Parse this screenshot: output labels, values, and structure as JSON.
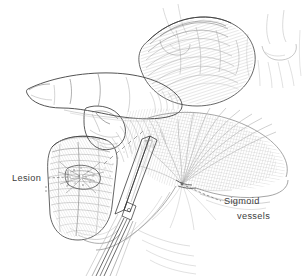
{
  "figure": {
    "kind": "surgical-line-illustration",
    "background_color": "#ffffff",
    "ink_color": "#4a4a4a",
    "hatch_color": "#9a9a9a",
    "label_color": "#3d3d3d"
  },
  "labels": [
    {
      "id": "lesion",
      "text": "Lesion",
      "text_x": 12,
      "text_y": 181,
      "anchor": "start",
      "leader_style": "dashed-horizontal-with-bracket"
    },
    {
      "id": "sigmoid-vessels",
      "line1": "Sigmoid",
      "line2": "vessels",
      "line1_x": 224,
      "line1_y": 204,
      "line2_x": 237,
      "line2_y": 219,
      "anchor": "start",
      "leader_style": "dashed-diagonal"
    }
  ],
  "structures": [
    {
      "id": "index-finger",
      "name": "surgeon index finger"
    },
    {
      "id": "thumb",
      "name": "surgeon thumb"
    },
    {
      "id": "sigmoid-loop",
      "name": "sigmoid colon loop"
    },
    {
      "id": "bowel-segment",
      "name": "bowel segment bearing lesion"
    },
    {
      "id": "lesion-mass",
      "name": "puckered lesion on antimesenteric wall"
    },
    {
      "id": "mesentery-fan",
      "name": "sigmoid mesentery with radiating vessels"
    },
    {
      "id": "clamp",
      "name": "long surgical clamp across mesentery"
    },
    {
      "id": "background-bowel",
      "name": "faint background bowel loops"
    }
  ]
}
